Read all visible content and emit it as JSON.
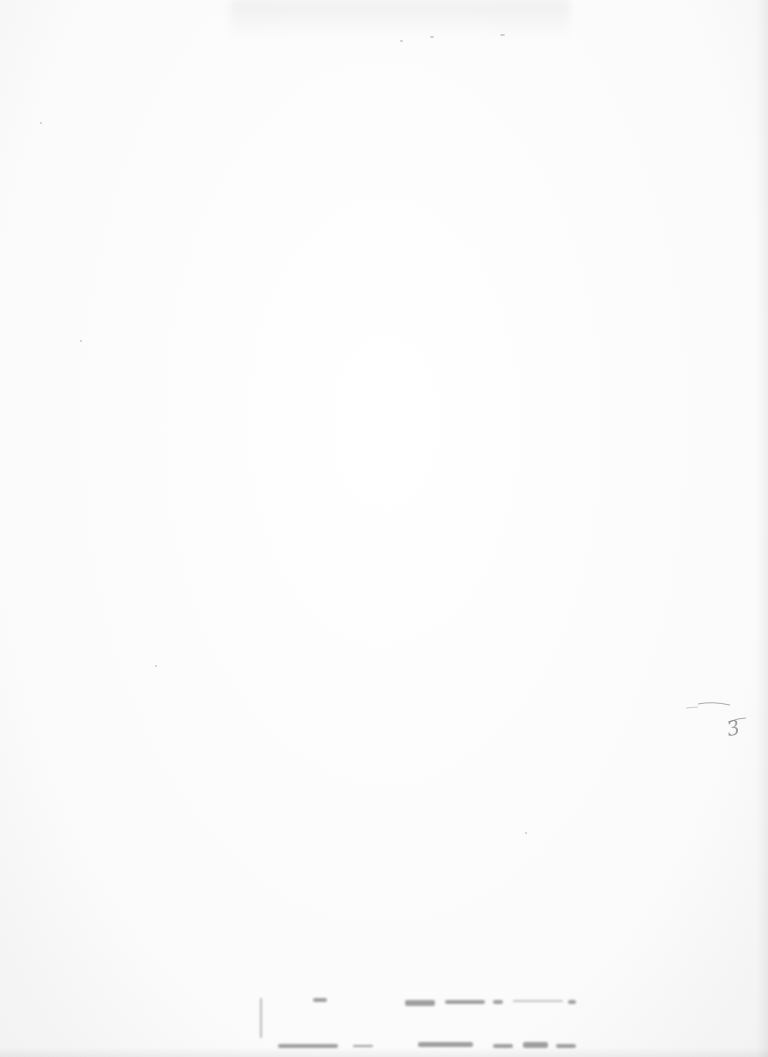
{
  "document": {
    "type": "scanned-blank-page",
    "handwritten_page_number": "3"
  }
}
